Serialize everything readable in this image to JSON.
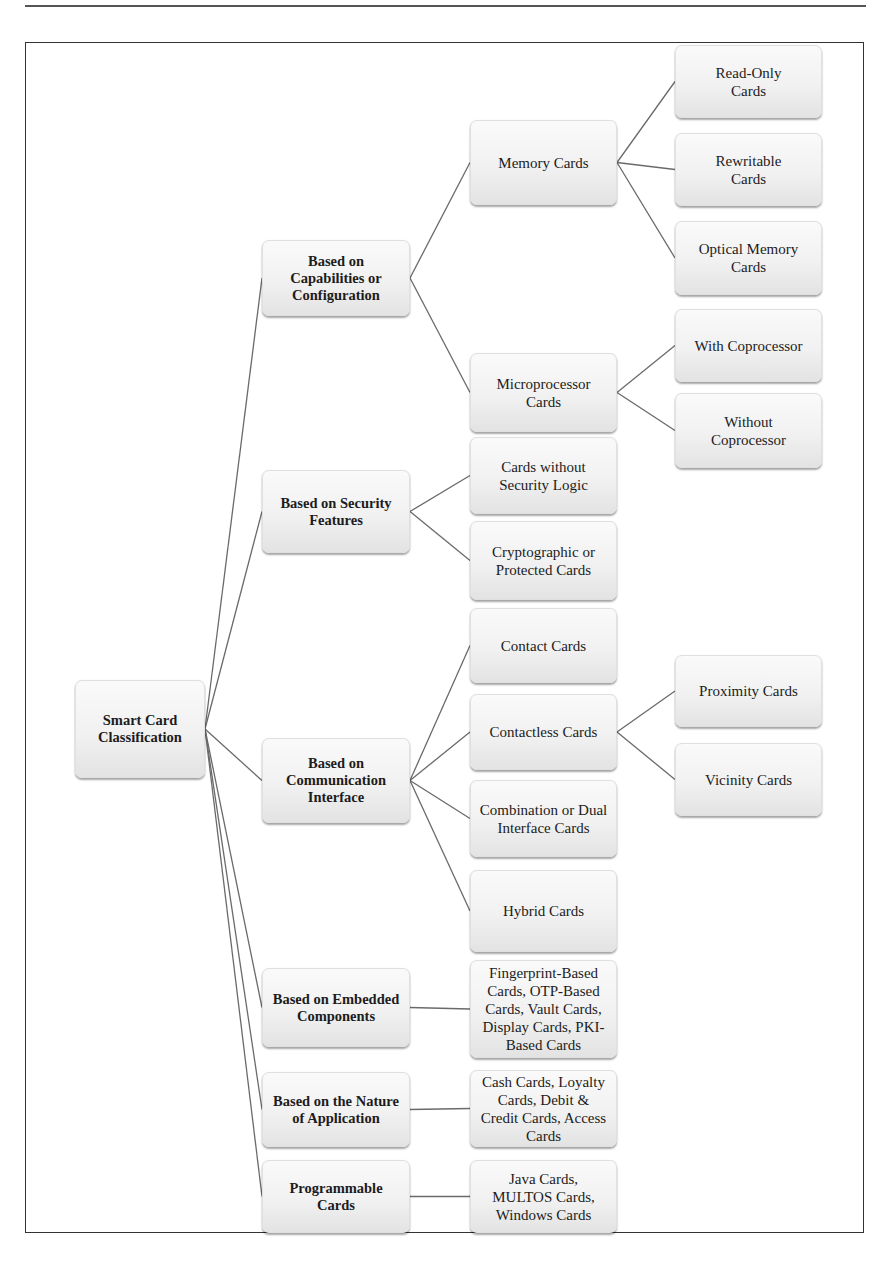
{
  "diagram": {
    "root": {
      "id": "root",
      "label": "Smart Card Classification"
    },
    "nodes": [
      {
        "id": "root",
        "label": "Smart Card Classification",
        "level": 0,
        "parent": null
      },
      {
        "id": "cap",
        "label": "Based on Capabilities or Configuration",
        "level": 1,
        "parent": "root"
      },
      {
        "id": "sec",
        "label": "Based on Security Features",
        "level": 1,
        "parent": "root"
      },
      {
        "id": "com",
        "label": "Based on Communication Interface",
        "level": 1,
        "parent": "root"
      },
      {
        "id": "emb",
        "label": "Based on Embedded Components",
        "level": 1,
        "parent": "root"
      },
      {
        "id": "nat",
        "label": "Based on the Nature of Application",
        "level": 1,
        "parent": "root"
      },
      {
        "id": "prg",
        "label": "Programmable Cards",
        "level": 1,
        "parent": "root"
      },
      {
        "id": "mem",
        "label": "Memory Cards",
        "level": 2,
        "parent": "cap"
      },
      {
        "id": "mic",
        "label": "Microprocessor Cards",
        "level": 2,
        "parent": "cap"
      },
      {
        "id": "nosec",
        "label": "Cards without Security Logic",
        "level": 2,
        "parent": "sec"
      },
      {
        "id": "cry",
        "label": "Cryptographic or Protected Cards",
        "level": 2,
        "parent": "sec"
      },
      {
        "id": "cnt",
        "label": "Contact Cards",
        "level": 2,
        "parent": "com"
      },
      {
        "id": "cls",
        "label": "Contactless Cards",
        "level": 2,
        "parent": "com"
      },
      {
        "id": "dual",
        "label": "Combination or Dual Interface Cards",
        "level": 2,
        "parent": "com"
      },
      {
        "id": "hyb",
        "label": "Hybrid Cards",
        "level": 2,
        "parent": "com"
      },
      {
        "id": "embl",
        "label": "Fingerprint-Based Cards, OTP-Based Cards, Vault Cards, Display Cards, PKI-Based Cards",
        "level": 2,
        "parent": "emb"
      },
      {
        "id": "natl",
        "label": "Cash Cards, Loyalty Cards, Debit & Credit Cards, Access Cards",
        "level": 2,
        "parent": "nat"
      },
      {
        "id": "prgl",
        "label": "Java Cards, MULTOS Cards, Windows Cards",
        "level": 2,
        "parent": "prg"
      },
      {
        "id": "ro",
        "label": "Read-Only Cards",
        "level": 3,
        "parent": "mem"
      },
      {
        "id": "rw",
        "label": "Rewritable Cards",
        "level": 3,
        "parent": "mem"
      },
      {
        "id": "opt",
        "label": "Optical Memory Cards",
        "level": 3,
        "parent": "mem"
      },
      {
        "id": "wc",
        "label": "With Coprocessor",
        "level": 3,
        "parent": "mic"
      },
      {
        "id": "woc",
        "label": "Without Coprocessor",
        "level": 3,
        "parent": "mic"
      },
      {
        "id": "prox",
        "label": "Proximity Cards",
        "level": 3,
        "parent": "cls"
      },
      {
        "id": "vic",
        "label": "Vicinity Cards",
        "level": 3,
        "parent": "cls"
      }
    ],
    "labels": {
      "root": [
        "Smart Card",
        "Classification"
      ],
      "cap": [
        "Based on",
        "Capabilities or",
        "Configuration"
      ],
      "sec": [
        "Based on Security",
        "Features"
      ],
      "com": [
        "Based on",
        "Communication",
        "Interface"
      ],
      "emb": [
        "Based on Embedded",
        "Components"
      ],
      "nat": [
        "Based on the Nature",
        "of Application"
      ],
      "prg": [
        "Programmable",
        "Cards"
      ],
      "mem": [
        "Memory Cards"
      ],
      "mic": [
        "Microprocessor",
        "Cards"
      ],
      "nosec": [
        "Cards without",
        "Security Logic"
      ],
      "cry": [
        "Cryptographic or",
        "Protected Cards"
      ],
      "cnt": [
        "Contact Cards"
      ],
      "cls": [
        "Contactless Cards"
      ],
      "dual": [
        "Combination or Dual",
        "Interface Cards"
      ],
      "hyb": [
        "Hybrid Cards"
      ],
      "embl": [
        "Fingerprint-Based",
        "Cards, OTP-Based",
        "Cards, Vault Cards,",
        "Display Cards, PKI-",
        "Based Cards"
      ],
      "natl": [
        "Cash Cards, Loyalty",
        "Cards, Debit &",
        "Credit Cards, Access",
        "Cards"
      ],
      "prgl": [
        "Java Cards,",
        "MULTOS Cards,",
        "Windows Cards"
      ],
      "ro": [
        "Read-Only",
        "Cards"
      ],
      "rw": [
        "Rewritable",
        "Cards"
      ],
      "opt": [
        "Optical Memory",
        "Cards"
      ],
      "wc": [
        "With Coprocessor"
      ],
      "woc": [
        "Without",
        "Coprocessor"
      ],
      "prox": [
        "Proximity Cards"
      ],
      "vic": [
        "Vicinity Cards"
      ]
    }
  }
}
